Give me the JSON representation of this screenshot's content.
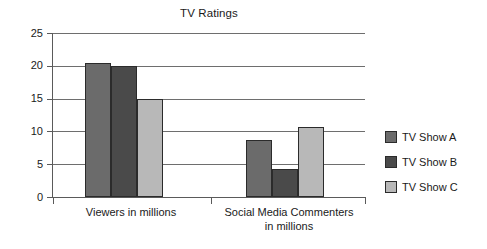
{
  "chart_data": {
    "type": "bar",
    "title": "TV Ratings",
    "xlabel": "",
    "ylabel": "",
    "ylim": [
      0,
      25
    ],
    "yticks": [
      0,
      5,
      10,
      15,
      20,
      25
    ],
    "ytick_labels": [
      "0",
      "5",
      "10",
      "15",
      "20",
      "25"
    ],
    "grid": true,
    "legend_position": "right",
    "categories": [
      "Viewers in millions",
      "Social Media Commenters in millions"
    ],
    "category_lines": [
      [
        "Viewers in millions"
      ],
      [
        "Social Media Commenters",
        "in millions"
      ]
    ],
    "series": [
      {
        "name": "TV Show A",
        "color": "#6b6b6b",
        "values": [
          20.4,
          8.7
        ]
      },
      {
        "name": "TV Show B",
        "color": "#4a4a4a",
        "values": [
          20.0,
          4.2
        ]
      },
      {
        "name": "TV Show C",
        "color": "#b8b8b8",
        "values": [
          15.0,
          10.7
        ]
      }
    ]
  },
  "legend": {
    "items": [
      {
        "label": "TV Show A",
        "color": "#6b6b6b"
      },
      {
        "label": "TV Show B",
        "color": "#4a4a4a"
      },
      {
        "label": "TV Show C",
        "color": "#b8b8b8"
      }
    ]
  },
  "colors": {
    "show_a": "#6b6b6b",
    "show_b": "#4a4a4a",
    "show_c": "#b8b8b8",
    "axis": "#5a5a5a",
    "gridline": "#6e6e6e",
    "bar_outline": "#2b2b2b",
    "text": "#1a1a1a",
    "background": "#ffffff"
  }
}
